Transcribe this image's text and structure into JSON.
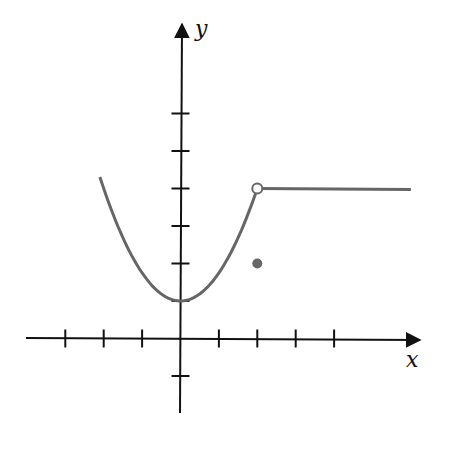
{
  "chart_data": {
    "type": "line",
    "title": "",
    "xlabel": "x",
    "ylabel": "y",
    "xlim": [
      -4.5,
      6.2
    ],
    "ylim": [
      -2,
      8
    ],
    "x_ticks": [
      -3,
      -2,
      -1,
      1,
      2,
      3,
      4
    ],
    "y_ticks": [
      -1,
      1,
      2,
      3,
      4,
      5,
      6
    ],
    "grid": false,
    "legend": null,
    "series": [
      {
        "name": "parabola piece",
        "formula": "y = 1 + 0.75x^2",
        "domain": [
          -2.1,
          2
        ],
        "points": [
          [
            -2.1,
            4.3
          ],
          [
            -2,
            4
          ],
          [
            -1.5,
            2.7
          ],
          [
            -1,
            1.75
          ],
          [
            -0.5,
            1.19
          ],
          [
            0,
            1
          ],
          [
            0.5,
            1.19
          ],
          [
            1,
            1.75
          ],
          [
            1.5,
            2.7
          ],
          [
            2,
            4
          ]
        ]
      },
      {
        "name": "constant piece",
        "formula": "y = 4",
        "domain": [
          2,
          6
        ],
        "points": [
          [
            2,
            4
          ],
          [
            6,
            4
          ]
        ]
      }
    ],
    "annotations": [
      {
        "type": "open_circle",
        "x": 2,
        "y": 4
      },
      {
        "type": "filled_circle",
        "x": 2,
        "y": 2
      }
    ],
    "colors": {
      "axis": "#111111",
      "curve": "#666666"
    }
  },
  "labels": {
    "x": "x",
    "y": "y"
  }
}
